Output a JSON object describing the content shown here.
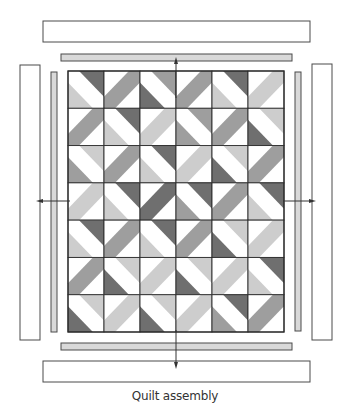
{
  "caption": "Quilt assembly",
  "colors": {
    "white": "#ffffff",
    "light": "#cdcdcd",
    "medium": "#9e9e9e",
    "dark": "#6f6f6f",
    "outline": "#4a4a4a",
    "inner_border_fill": "#d9d9d9",
    "outer_border_fill": "#ffffff",
    "arrow": "#333333"
  },
  "quilt": {
    "columns": 6,
    "rows": 7,
    "blocks": [
      [
        {
          "type": "split",
          "tr": "dark",
          "bl": "light"
        },
        {
          "type": "band",
          "band": "medium"
        },
        {
          "type": "split",
          "tr": "medium",
          "bl": "dark"
        },
        {
          "type": "band",
          "band": "medium"
        },
        {
          "type": "split",
          "tr": "dark",
          "bl": "light"
        },
        {
          "type": "band",
          "band": "light"
        }
      ],
      [
        {
          "type": "band",
          "band": "medium"
        },
        {
          "type": "split",
          "tr": "dark",
          "bl": "light"
        },
        {
          "type": "band",
          "band": "light"
        },
        {
          "type": "split",
          "tr": "medium",
          "bl": "medium"
        },
        {
          "type": "band",
          "band": "medium"
        },
        {
          "type": "split",
          "tr": "light",
          "bl": "dark"
        }
      ],
      [
        {
          "type": "split",
          "tr": "light",
          "bl": "medium"
        },
        {
          "type": "band",
          "band": "medium"
        },
        {
          "type": "split",
          "tr": "dark",
          "bl": "light"
        },
        {
          "type": "band",
          "band": "light"
        },
        {
          "type": "split",
          "tr": "light",
          "bl": "dark"
        },
        {
          "type": "band",
          "band": "medium"
        }
      ],
      [
        {
          "type": "band",
          "band": "light"
        },
        {
          "type": "split",
          "tr": "dark",
          "bl": "light"
        },
        {
          "type": "band",
          "band": "dark"
        },
        {
          "type": "split",
          "tr": "dark",
          "bl": "medium"
        },
        {
          "type": "band",
          "band": "medium"
        },
        {
          "type": "split",
          "tr": "dark",
          "bl": "light"
        }
      ],
      [
        {
          "type": "split",
          "tr": "dark",
          "bl": "light"
        },
        {
          "type": "band",
          "band": "medium"
        },
        {
          "type": "split",
          "tr": "dark",
          "bl": "light"
        },
        {
          "type": "band",
          "band": "medium"
        },
        {
          "type": "split",
          "tr": "light",
          "bl": "dark"
        },
        {
          "type": "band",
          "band": "light"
        }
      ],
      [
        {
          "type": "band",
          "band": "medium"
        },
        {
          "type": "split",
          "tr": "light",
          "bl": "dark"
        },
        {
          "type": "band",
          "band": "light"
        },
        {
          "type": "split",
          "tr": "light",
          "bl": "dark"
        },
        {
          "type": "band",
          "band": "light"
        },
        {
          "type": "split",
          "tr": "dark",
          "bl": "light"
        }
      ],
      [
        {
          "type": "split",
          "tr": "light",
          "bl": "dark"
        },
        {
          "type": "band",
          "band": "light"
        },
        {
          "type": "split",
          "tr": "light",
          "bl": "dark"
        },
        {
          "type": "band",
          "band": "light"
        },
        {
          "type": "split",
          "tr": "dark",
          "bl": "medium"
        },
        {
          "type": "band",
          "band": "medium"
        }
      ]
    ]
  },
  "borders": {
    "inner": [
      "top",
      "bottom",
      "left",
      "right"
    ],
    "outer": [
      "top",
      "bottom",
      "left",
      "right"
    ]
  },
  "arrows": [
    "up",
    "down",
    "left",
    "right"
  ]
}
